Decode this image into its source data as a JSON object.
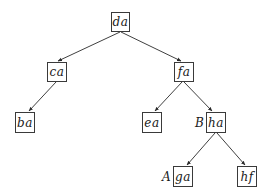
{
  "diagram": {
    "type": "tree",
    "nodes": [
      {
        "id": "da",
        "label": "da",
        "x": 111,
        "y": 12,
        "w": 19,
        "h": 20
      },
      {
        "id": "ca",
        "label": "ca",
        "x": 47,
        "y": 62,
        "w": 20,
        "h": 20
      },
      {
        "id": "fa",
        "label": "fa",
        "x": 174,
        "y": 62,
        "w": 20,
        "h": 20
      },
      {
        "id": "ba",
        "label": "ba",
        "x": 15,
        "y": 112,
        "w": 20,
        "h": 21
      },
      {
        "id": "ea",
        "label": "ea",
        "x": 142,
        "y": 112,
        "w": 20,
        "h": 21
      },
      {
        "id": "ha",
        "label": "ha",
        "x": 206,
        "y": 112,
        "w": 20,
        "h": 21
      },
      {
        "id": "ga",
        "label": "ga",
        "x": 173,
        "y": 166,
        "w": 20,
        "h": 21
      },
      {
        "id": "hf",
        "label": "hf",
        "x": 237,
        "y": 166,
        "w": 20,
        "h": 21
      }
    ],
    "edges": [
      {
        "from": "da",
        "to": "ca"
      },
      {
        "from": "da",
        "to": "fa"
      },
      {
        "from": "ca",
        "to": "ba"
      },
      {
        "from": "fa",
        "to": "ea"
      },
      {
        "from": "fa",
        "to": "ha"
      },
      {
        "from": "ha",
        "to": "ga"
      },
      {
        "from": "ha",
        "to": "hf"
      }
    ],
    "side_labels": [
      {
        "text": "B",
        "attached_to": "ha"
      },
      {
        "text": "A",
        "attached_to": "ga"
      }
    ]
  }
}
